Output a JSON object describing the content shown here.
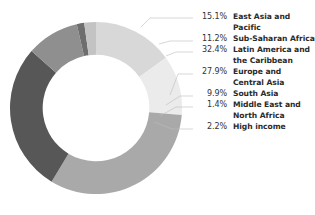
{
  "chart_data": {
    "type": "pie",
    "variant": "donut",
    "title": "",
    "subtitle": "",
    "xlabel": "",
    "ylabel": "",
    "legend_position": "right",
    "grid": false,
    "units": "percent",
    "start_angle_deg": 0,
    "direction": "clockwise",
    "inner_radius_ratio": 0.62,
    "categories": [
      "East Asia and Pacific",
      "Sub-Saharan Africa",
      "Latin America and the Caribbean",
      "Europe and Central Asia",
      "South Asia",
      "Middle East and North Africa",
      "High income"
    ],
    "values": [
      15.1,
      11.2,
      32.4,
      27.9,
      9.9,
      1.4,
      2.2
    ],
    "value_labels": [
      "15.1%",
      "11.2%",
      "32.4%",
      "27.9%",
      "9.9%",
      "1.4%",
      "2.2%"
    ],
    "colors": [
      "#d8d8d8",
      "#ebebeb",
      "#a9a9a9",
      "#575757",
      "#8f8f8f",
      "#6e6e6e",
      "#c3c3c3"
    ],
    "slices": [
      {
        "label": "East Asia and Pacific",
        "label_lines": "East Asia and\nPacific",
        "value": 15.1,
        "value_label": "15.1%",
        "color": "#d8d8d8"
      },
      {
        "label": "Sub-Saharan Africa",
        "label_lines": "Sub-Saharan Africa",
        "value": 11.2,
        "value_label": "11.2%",
        "color": "#ebebeb"
      },
      {
        "label": "Latin America and the Caribbean",
        "label_lines": "Latin America and\nthe Caribbean",
        "value": 32.4,
        "value_label": "32.4%",
        "color": "#a9a9a9"
      },
      {
        "label": "Europe and Central Asia",
        "label_lines": "Europe and\nCentral Asia",
        "value": 27.9,
        "value_label": "27.9%",
        "color": "#575757"
      },
      {
        "label": "South Asia",
        "label_lines": "South Asia",
        "value": 9.9,
        "value_label": "9.9%",
        "color": "#8f8f8f"
      },
      {
        "label": "Middle East and North Africa",
        "label_lines": "Middle East and\nNorth Africa",
        "value": 1.4,
        "value_label": "1.4%",
        "color": "#6e6e6e"
      },
      {
        "label": "High income",
        "label_lines": "High income",
        "value": 2.2,
        "value_label": "2.2%",
        "color": "#c3c3c3"
      }
    ]
  },
  "legend": {
    "rows": [
      {
        "pct": "15.1%",
        "label": "East Asia and\nPacific"
      },
      {
        "pct": "11.2%",
        "label": "Sub-Saharan Africa"
      },
      {
        "pct": "32.4%",
        "label": "Latin America and\nthe Caribbean"
      },
      {
        "pct": "27.9%",
        "label": "Europe and\nCentral Asia"
      },
      {
        "pct": "9.9%",
        "label": "South Asia"
      },
      {
        "pct": "1.4%",
        "label": "Middle East and\nNorth Africa"
      },
      {
        "pct": "2.2%",
        "label": "High income"
      }
    ]
  },
  "colors": {
    "background": "#ffffff",
    "text": "#2b2b2b",
    "pct_text": "#333333",
    "leader_line": "#bcbcbc"
  }
}
